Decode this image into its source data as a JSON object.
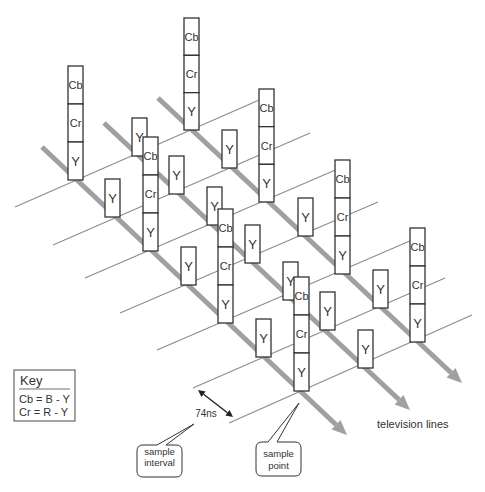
{
  "diagram": {
    "television_lines_label": "television lines",
    "interval_label": "74ns",
    "key": {
      "title": "Key",
      "entries": [
        "Cb = B - Y",
        "Cr = R - Y"
      ]
    },
    "callouts": {
      "sample_interval": {
        "lines": [
          "sample",
          "interval"
        ]
      },
      "sample_point": {
        "lines": [
          "sample",
          "point"
        ]
      }
    },
    "television_lines": [
      {
        "samples": [
          {
            "components": [
              "Cb",
              "Cr",
              "Y"
            ]
          },
          {
            "components": [
              "Y"
            ]
          },
          {
            "components": [
              "Cb",
              "Cr",
              "Y"
            ]
          },
          {
            "components": [
              "Y"
            ]
          },
          {
            "components": [
              "Cb",
              "Cr",
              "Y"
            ]
          },
          {
            "components": [
              "Y"
            ]
          },
          {
            "components": [
              "Cb",
              "Cr",
              "Y"
            ]
          }
        ]
      },
      {
        "samples": [
          {
            "components": [
              "Y"
            ]
          },
          {
            "components": [
              "Y"
            ]
          },
          {
            "components": [
              "Y"
            ]
          },
          {
            "components": [
              "Y"
            ]
          },
          {
            "components": [
              "Y"
            ]
          },
          {
            "components": [
              "Y"
            ]
          },
          {
            "components": [
              "Y"
            ]
          }
        ]
      },
      {
        "samples": [
          {
            "components": [
              "Cb",
              "Cr",
              "Y"
            ]
          },
          {
            "components": [
              "Y"
            ]
          },
          {
            "components": [
              "Cb",
              "Cr",
              "Y"
            ]
          },
          {
            "components": [
              "Y"
            ]
          },
          {
            "components": [
              "Cb",
              "Cr",
              "Y"
            ]
          },
          {
            "components": [
              "Y"
            ]
          },
          {
            "components": [
              "Cb",
              "Cr",
              "Y"
            ]
          }
        ]
      }
    ],
    "colors": {
      "television_line": "#a0a0a0",
      "sample_line": "#8c8c8c",
      "box_stroke": "#333333",
      "text": "#333333",
      "background": "#ffffff"
    }
  }
}
